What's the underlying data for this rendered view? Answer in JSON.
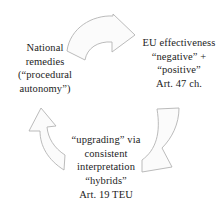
{
  "diagram": {
    "type": "cycle-diagram",
    "background_color": "#ffffff",
    "text_color": "#1c1c1c",
    "arrow_stroke_color": "#b3b3b3",
    "arrow_fill_color": "#fbfbfb",
    "blocks": [
      {
        "id": "national-remedies",
        "position": "left",
        "lines": [
          "National",
          "remedies",
          "(“procedural",
          "autonomy”)"
        ]
      },
      {
        "id": "eu-effectiveness",
        "position": "right",
        "lines": [
          "EU effectiveness",
          "“negative” +",
          "“positive”",
          "Art. 47 ch."
        ]
      },
      {
        "id": "upgrading",
        "position": "bottom",
        "lines": [
          "“upgrading” via",
          "consistent",
          "interpretation",
          "“hybrids”",
          "Art. 19 TEU"
        ]
      }
    ],
    "arrows": [
      {
        "id": "arrow-top",
        "name": "curved-arrow-top-right",
        "from": "national-remedies",
        "to": "eu-effectiveness",
        "direction": "right-down"
      },
      {
        "id": "arrow-right",
        "name": "curved-arrow-right-down",
        "from": "eu-effectiveness",
        "to": "upgrading",
        "direction": "down-left"
      },
      {
        "id": "arrow-left",
        "name": "curved-arrow-left-up",
        "from": "upgrading",
        "to": "national-remedies",
        "direction": "up-left"
      }
    ]
  }
}
